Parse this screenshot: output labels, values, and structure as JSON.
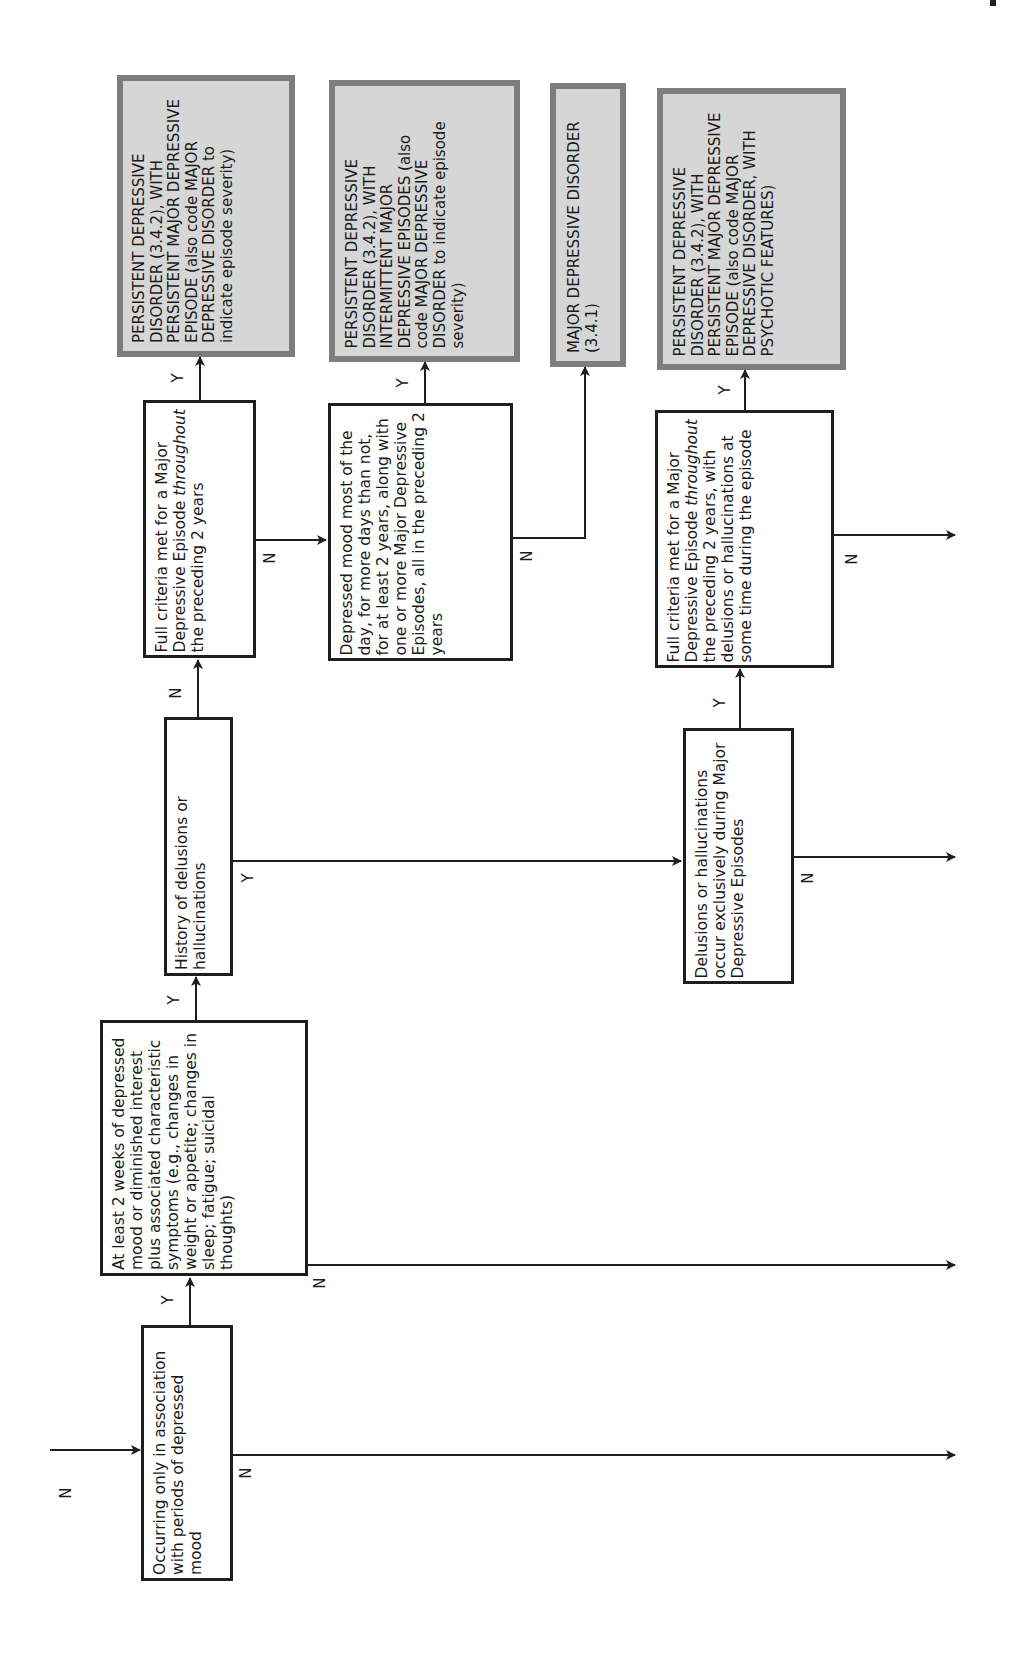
{
  "diagram": {
    "orientation": "rotated-90-ccw",
    "colors": {
      "line": "#1e1e1e",
      "outcome_fill": "#d6d6d6",
      "outcome_border": "#7d7d7d",
      "background": "#ffffff"
    },
    "nodes": {
      "occurring_only": {
        "type": "decision",
        "text": "Occurring only in association with periods of depressed mood"
      },
      "two_weeks": {
        "type": "decision",
        "text": "At least 2 weeks of depressed mood or diminished interest plus associated characteristic symptoms (e.g., changes in weight or appetite; changes in sleep; fatigue; suicidal thoughts)"
      },
      "history_delusions": {
        "type": "decision",
        "text": "History of delusions or hallucinations"
      },
      "full_criteria_2y": {
        "type": "decision",
        "pre": "Full criteria met for a Major Depressive Episode ",
        "em": "throughout",
        "post": " the preceding 2 years"
      },
      "depressed_mood_2y": {
        "type": "decision",
        "text": "Depressed mood most of the day, for more days than not, for at least 2 years, along with one or more Major Depressive Episodes, all in the preceding 2 years"
      },
      "delusions_exclusive": {
        "type": "decision",
        "text": "Delusions or hallucinations occur exclusively during Major Depressive Episodes"
      },
      "full_criteria_psychotic": {
        "type": "decision",
        "pre": "Full criteria met for a Major Depressive Episode ",
        "em": "throughout",
        "post": " the preceding 2 years, with delusions or hallucinations at some time during the episode"
      },
      "out_pdd_persistent": {
        "type": "outcome",
        "text": "PERSISTENT DEPRESSIVE DISORDER (3.4.2), WITH PERSISTENT MAJOR DEPRESSIVE EPISODE (also code MAJOR DEPRESSIVE DISORDER to indicate episode severity)"
      },
      "out_pdd_intermittent": {
        "type": "outcome",
        "text": "PERSISTENT DEPRESSIVE DISORDER (3.4.2), WITH INTERMITTENT MAJOR DEPRESSIVE EPISODES (also code MAJOR DEPRESSIVE DISORDER to indicate episode severity)"
      },
      "out_mdd": {
        "type": "outcome",
        "text": "MAJOR DEPRESSIVE DISORDER (3.4.1)"
      },
      "out_pdd_psychotic": {
        "type": "outcome",
        "text": "PERSISTENT DEPRESSIVE DISORDER (3.4.2), WITH PERSISTENT MAJOR DEPRESSIVE EPISODE (also code MAJOR DEPRESSIVE DISORDER, WITH PSYCHOTIC FEATURES)"
      }
    },
    "edge_labels": {
      "entry_n": "N",
      "occurring_y": "Y",
      "occurring_n": "N",
      "two_weeks_y": "Y",
      "two_weeks_n": "N",
      "history_n": "N",
      "history_y": "Y",
      "full_2y_y": "Y",
      "full_2y_n": "N",
      "depressed_y": "Y",
      "depressed_n": "N",
      "exclusive_y": "Y",
      "exclusive_n": "N",
      "psychotic_y": "Y",
      "psychotic_n": "N"
    }
  }
}
